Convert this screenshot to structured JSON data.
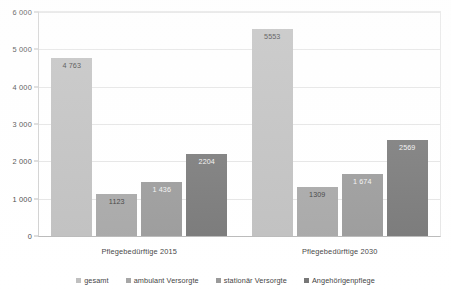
{
  "chart_data": {
    "type": "bar",
    "title": "",
    "subtitle": "",
    "xlabel": "",
    "ylabel": "",
    "categories": [
      "Pflegebedürftige 2015",
      "Pflegebedürftige 2030"
    ],
    "series": [
      {
        "name": "gesamt",
        "color": "#bfbfbf",
        "values": [
          4763,
          5553
        ],
        "labels": [
          "4 763",
          "5553"
        ],
        "label_style": "on-light"
      },
      {
        "name": "ambulant Versorgte",
        "color": "#a6a6a6",
        "values": [
          1123,
          1309
        ],
        "labels": [
          "1123",
          "1309"
        ],
        "label_style": "on-light"
      },
      {
        "name": "stationär Versorgte",
        "color": "#999999",
        "values": [
          1436,
          1674
        ],
        "labels": [
          "1 436",
          "1 674"
        ],
        "label_style": "on-dark"
      },
      {
        "name": "Angehörigenpflege",
        "color": "#767676",
        "values": [
          2204,
          2569
        ],
        "labels": [
          "2204",
          "2569"
        ],
        "label_style": "on-dark"
      }
    ],
    "ylim": [
      0,
      6000
    ],
    "ytick_step": 1000,
    "ytick_labels": [
      "0",
      "1 000",
      "2 000",
      "3 000",
      "4 000",
      "5 000",
      "6 000"
    ],
    "ytick_values": [
      0,
      1000,
      2000,
      3000,
      4000,
      5000,
      6000
    ],
    "grid": true,
    "grid_axis": "y",
    "legend_position": "bottom",
    "legend_entries": [
      "gesamt",
      "ambulant Versorgte",
      "stationär Versorgte",
      "Angehörigenpflege"
    ]
  },
  "colors": {
    "plot_background": "#ffffff",
    "gridline": "#e4e4e4",
    "axis_line": "#b8b8b8",
    "text": "#3f3f3f"
  }
}
